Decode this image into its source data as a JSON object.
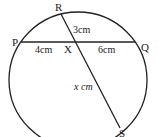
{
  "diagram": {
    "type": "circle-intersecting-chords",
    "points": {
      "P": "P",
      "Q": "Q",
      "R": "R",
      "S": "S",
      "X": "X"
    },
    "labels": {
      "PX": "4cm",
      "XQ": "6cm",
      "RX": "3cm",
      "XS": "x cm"
    },
    "colors": {
      "stroke": "#222222",
      "background": "#ffffff"
    }
  }
}
